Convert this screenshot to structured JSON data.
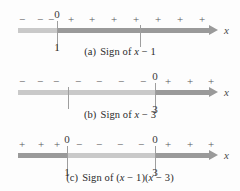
{
  "figure": {
    "axis_label": "x",
    "plus": "+",
    "minus": "−",
    "zero_label": "0",
    "colors": {
      "line_light": "#c9c9c9",
      "line_dark": "#9a9a9a",
      "tick": "#9e9e9e",
      "text": "#2b2b2b",
      "background": "#fdfdfd"
    }
  },
  "panels": [
    {
      "id": "a",
      "caption_label": "(a)",
      "caption_text": "Sign of x − 1",
      "caption_prefix": "Sign of ",
      "expression_parts": [
        {
          "text": "x",
          "italic": true
        },
        {
          "text": " − 1",
          "italic": false
        }
      ],
      "line_y": 30,
      "axis_start": 18,
      "axis_end": 218,
      "ticks": [
        {
          "x": 57,
          "labeled": true,
          "above": "0",
          "below": "1",
          "tall": true
        },
        {
          "x": 140,
          "labeled": false,
          "above": "",
          "below": "",
          "tall": false
        }
      ],
      "segments": [
        {
          "from": 18,
          "to": 57,
          "tone": "light"
        },
        {
          "from": 57,
          "to": 209,
          "tone": "dark"
        }
      ],
      "signs": [
        {
          "x": 22,
          "sign": "−"
        },
        {
          "x": 40,
          "sign": "−"
        },
        {
          "x": 51,
          "sign": "−"
        },
        {
          "x": 71,
          "sign": "+"
        },
        {
          "x": 92,
          "sign": "+"
        },
        {
          "x": 114,
          "sign": "+"
        },
        {
          "x": 136,
          "sign": "+"
        },
        {
          "x": 158,
          "sign": "+"
        },
        {
          "x": 180,
          "sign": "+"
        },
        {
          "x": 202,
          "sign": "+"
        }
      ],
      "caption_y": 46
    },
    {
      "id": "b",
      "caption_label": "(b)",
      "caption_text": "Sign of x − 3",
      "caption_prefix": "Sign of ",
      "expression_parts": [
        {
          "text": "x",
          "italic": true
        },
        {
          "text": " − 3",
          "italic": false
        }
      ],
      "line_y": 92,
      "axis_start": 18,
      "axis_end": 218,
      "ticks": [
        {
          "x": 68,
          "labeled": false,
          "above": "",
          "below": "",
          "tall": false
        },
        {
          "x": 155,
          "labeled": true,
          "above": "0",
          "below": "3",
          "tall": true
        }
      ],
      "segments": [
        {
          "from": 18,
          "to": 155,
          "tone": "light"
        },
        {
          "from": 155,
          "to": 209,
          "tone": "dark"
        }
      ],
      "signs": [
        {
          "x": 22,
          "sign": "−"
        },
        {
          "x": 40,
          "sign": "−"
        },
        {
          "x": 56,
          "sign": "−"
        },
        {
          "x": 78,
          "sign": "−"
        },
        {
          "x": 99,
          "sign": "−"
        },
        {
          "x": 121,
          "sign": "−"
        },
        {
          "x": 143,
          "sign": "−"
        },
        {
          "x": 168,
          "sign": "+"
        },
        {
          "x": 190,
          "sign": "+"
        },
        {
          "x": 211,
          "sign": "+"
        }
      ],
      "caption_y": 109
    },
    {
      "id": "c",
      "caption_label": "(c)",
      "caption_text": "Sign of (x − 1)(x − 3)",
      "caption_prefix": "Sign of ",
      "expression_parts": [
        {
          "text": "(",
          "italic": false
        },
        {
          "text": "x",
          "italic": true
        },
        {
          "text": " − 1)(",
          "italic": false
        },
        {
          "text": "x",
          "italic": true
        },
        {
          "text": " − 3)",
          "italic": false
        }
      ],
      "line_y": 155,
      "axis_start": 18,
      "axis_end": 218,
      "ticks": [
        {
          "x": 67,
          "labeled": true,
          "above": "0",
          "below": "1",
          "tall": true
        },
        {
          "x": 155,
          "labeled": true,
          "above": "0",
          "below": "3",
          "tall": true
        }
      ],
      "segments": [
        {
          "from": 18,
          "to": 67,
          "tone": "dark"
        },
        {
          "from": 67,
          "to": 155,
          "tone": "light"
        },
        {
          "from": 155,
          "to": 209,
          "tone": "dark"
        }
      ],
      "signs": [
        {
          "x": 22,
          "sign": "+"
        },
        {
          "x": 41,
          "sign": "+"
        },
        {
          "x": 57,
          "sign": "+"
        },
        {
          "x": 79,
          "sign": "−"
        },
        {
          "x": 99,
          "sign": "−"
        },
        {
          "x": 120,
          "sign": "−"
        },
        {
          "x": 141,
          "sign": "−"
        },
        {
          "x": 168,
          "sign": "+"
        },
        {
          "x": 190,
          "sign": "+"
        },
        {
          "x": 211,
          "sign": "+"
        }
      ],
      "caption_y": 172
    }
  ]
}
